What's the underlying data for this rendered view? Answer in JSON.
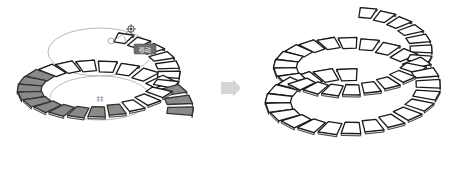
{
  "figure": {
    "left_panel": {
      "name": "before-transform",
      "selected_tile_color": "#8a8a8a",
      "unselected_tile_color": "#ffffff",
      "gizmo_label": "移动",
      "center_marker": "‡‡"
    },
    "arrow": {
      "name": "transform-arrow",
      "color": "#d6d6d6"
    },
    "right_panel": {
      "name": "after-transform",
      "tile_color": "#ffffff"
    }
  }
}
